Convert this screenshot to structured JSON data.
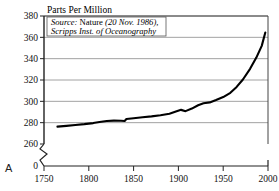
{
  "figure": {
    "panel_letter": "A",
    "ylabel": "Parts Per Million",
    "source_line1_italic": "Source:",
    "source_line1_roman": " Nature",
    "source_line1_tail": " (20 Nov. 1986),",
    "source_line2": "Scripps Inst. of Oceanography"
  },
  "chart_data": {
    "type": "line",
    "title": "",
    "xlabel": "",
    "ylabel": "Parts Per Million",
    "xlim": [
      1750,
      2000
    ],
    "ylim": [
      260,
      380
    ],
    "yticks": [
      260,
      280,
      300,
      320,
      340,
      360,
      380
    ],
    "ytick_labels": [
      "260",
      "280",
      "300",
      "320",
      "340",
      "360",
      "380"
    ],
    "xticks": [
      1750,
      1800,
      1850,
      1900,
      1950,
      2000
    ],
    "xtick_labels": [
      "1750",
      "1800",
      "1850",
      "1900",
      "1950",
      "2000"
    ],
    "axis_break": true,
    "axis_break_label": "0",
    "grid": "horizontal",
    "legend": "none",
    "series": [
      {
        "name": "Atmospheric CO2 concentration",
        "color": "#000000",
        "x": [
          1765,
          1775,
          1785,
          1795,
          1805,
          1812,
          1820,
          1828,
          1836,
          1840,
          1842,
          1850,
          1860,
          1870,
          1880,
          1890,
          1898,
          1903,
          1908,
          1915,
          1922,
          1928,
          1935,
          1942,
          1950,
          1958,
          1965,
          1972,
          1980,
          1987,
          1993,
          1997
        ],
        "values": [
          276.3,
          277.0,
          277.8,
          278.6,
          279.6,
          280.7,
          281.6,
          281.9,
          281.8,
          281.6,
          283.4,
          284.1,
          285.0,
          285.9,
          287.0,
          288.3,
          290.6,
          292.0,
          290.8,
          293.2,
          296.3,
          298.2,
          299.0,
          301.2,
          304.0,
          308.0,
          313.5,
          320.5,
          330.5,
          341.0,
          352.0,
          364.5
        ]
      }
    ]
  }
}
